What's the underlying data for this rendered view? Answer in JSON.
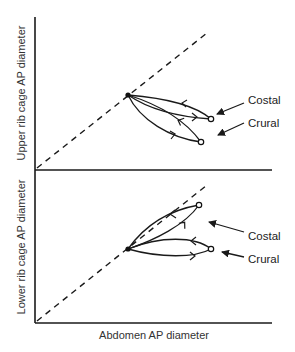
{
  "diagram": {
    "top_panel": {
      "y_axis_label": "Upper rib cage AP diameter",
      "labels": {
        "costal": "Costal",
        "crural": "Crural"
      }
    },
    "bottom_panel": {
      "y_axis_label": "Lower rib cage AP diameter",
      "labels": {
        "costal": "Costal",
        "crural": "Crural"
      }
    },
    "x_axis_label": "Abdomen AP diameter",
    "colors": {
      "line": "#1a1a1a",
      "background": "#ffffff"
    }
  }
}
